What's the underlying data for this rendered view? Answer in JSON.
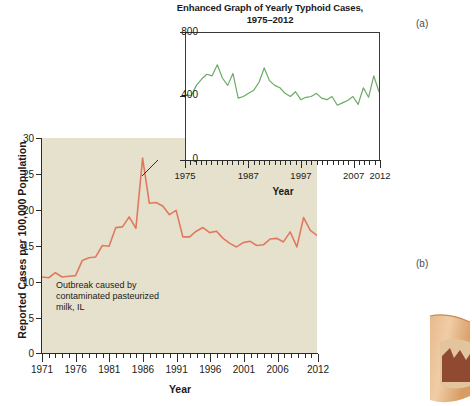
{
  "panels": {
    "a_label": "(a)",
    "b_label": "(b)"
  },
  "inset": {
    "title_line1": "Enhanced Graph of Yearly Typhoid Cases,",
    "title_line2": "1975–2012",
    "xlabel": "Year",
    "y_ticks": [
      "800",
      "400",
      "0"
    ],
    "x_ticks": [
      "1975",
      "1987",
      "1997",
      "2007",
      "2012"
    ]
  },
  "main": {
    "ylabel": "Reported Cases per 100,000 Population",
    "xlabel": "Year",
    "y_ticks": [
      "30",
      "25",
      "20",
      "15",
      "10",
      "5",
      "0"
    ],
    "x_ticks": [
      "1971",
      "1976",
      "1981",
      "1986",
      "1991",
      "1996",
      "2001",
      "2006",
      "2012"
    ],
    "annotation": "Outbreak caused by contaminated pasteurized milk, IL"
  },
  "colors": {
    "main_line": "#e07a5f",
    "inset_line": "#6aaa64",
    "main_plot_bg": "#e6e1cc",
    "inset_plot_bg": "#ffffff",
    "axis": "#2a2a2a",
    "text": "#1a1a1a"
  },
  "chart_data": [
    {
      "type": "line",
      "id": "inset-a",
      "title": "Enhanced Graph of Yearly Typhoid Cases, 1975–2012",
      "xlabel": "Year",
      "ylabel": "",
      "ylim": [
        0,
        800
      ],
      "xlim": [
        1975,
        2012
      ],
      "yticks": [
        0,
        400,
        800
      ],
      "xticks": [
        1975,
        1987,
        1997,
        2007,
        2012
      ],
      "grid": false,
      "legend": "none",
      "series": [
        {
          "name": "Reported typhoid cases",
          "color": "#6aaa64",
          "x": [
            1975,
            1976,
            1977,
            1978,
            1979,
            1980,
            1981,
            1982,
            1983,
            1984,
            1985,
            1986,
            1987,
            1988,
            1989,
            1990,
            1991,
            1992,
            1993,
            1994,
            1995,
            1996,
            1997,
            1998,
            1999,
            2000,
            2001,
            2002,
            2003,
            2004,
            2005,
            2006,
            2007,
            2008,
            2009,
            2010,
            2011,
            2012
          ],
          "values": [
            410,
            405,
            470,
            510,
            540,
            530,
            600,
            515,
            470,
            545,
            390,
            400,
            420,
            440,
            490,
            580,
            500,
            470,
            455,
            420,
            400,
            430,
            380,
            395,
            400,
            420,
            390,
            380,
            400,
            345,
            360,
            375,
            400,
            350,
            455,
            395,
            530,
            430
          ]
        }
      ]
    },
    {
      "type": "line",
      "id": "main-b",
      "title": "",
      "xlabel": "Year",
      "ylabel": "Reported Cases per 100,000 Population",
      "ylim": [
        0,
        30
      ],
      "xlim": [
        1971,
        2012
      ],
      "yticks": [
        0,
        5,
        10,
        15,
        20,
        25,
        30
      ],
      "xticks": [
        1971,
        1976,
        1981,
        1986,
        1991,
        1996,
        2001,
        2006,
        2012
      ],
      "grid": false,
      "legend": "none",
      "annotations": [
        {
          "text": "Outbreak caused by contaminated pasteurized milk, IL",
          "x": 1985,
          "y": 27.2
        }
      ],
      "series": [
        {
          "name": "Reported cases per 100,000 population",
          "color": "#e07a5f",
          "x": [
            1971,
            1972,
            1973,
            1974,
            1975,
            1976,
            1977,
            1978,
            1979,
            1980,
            1981,
            1982,
            1983,
            1984,
            1985,
            1986,
            1987,
            1988,
            1989,
            1990,
            1991,
            1992,
            1993,
            1994,
            1995,
            1996,
            1997,
            1998,
            1999,
            2000,
            2001,
            2002,
            2003,
            2004,
            2005,
            2006,
            2007,
            2008,
            2009,
            2010,
            2011,
            2012
          ],
          "values": [
            10.6,
            10.5,
            11.2,
            10.6,
            10.7,
            10.8,
            12.9,
            13.3,
            13.4,
            15.0,
            14.9,
            17.5,
            17.6,
            19.0,
            17.4,
            27.2,
            20.9,
            21.0,
            20.5,
            19.3,
            19.9,
            16.2,
            16.2,
            17.0,
            17.5,
            16.8,
            17.0,
            16.0,
            15.3,
            14.8,
            15.4,
            15.6,
            15.0,
            15.1,
            15.9,
            16.0,
            15.5,
            16.9,
            14.8,
            18.9,
            17.1,
            16.4
          ]
        }
      ]
    }
  ]
}
